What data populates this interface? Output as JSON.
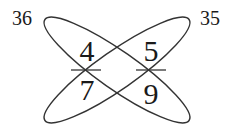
{
  "diagram": {
    "type": "cross-multiplication",
    "left_fraction": {
      "numerator": "4",
      "denominator": "7"
    },
    "right_fraction": {
      "numerator": "5",
      "denominator": "9"
    },
    "left_product": "36",
    "right_product": "35",
    "stroke_color": "#333333",
    "text_color": "#1a1a1a"
  }
}
